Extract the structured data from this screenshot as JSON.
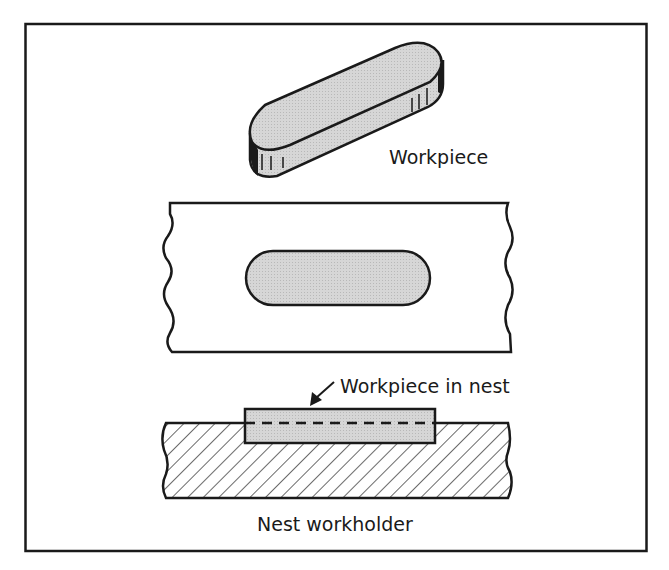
{
  "figure": {
    "labels": {
      "workpiece": "Workpiece",
      "workpiece_in_nest": "Workpiece in nest",
      "nest_workholder": "Nest workholder"
    },
    "colors": {
      "line": "#1a1a1a",
      "fill_gray": "#cfcfcf",
      "background": "#ffffff"
    },
    "views": [
      "isometric-workpiece",
      "top-view-nest",
      "section-view-nest"
    ]
  }
}
